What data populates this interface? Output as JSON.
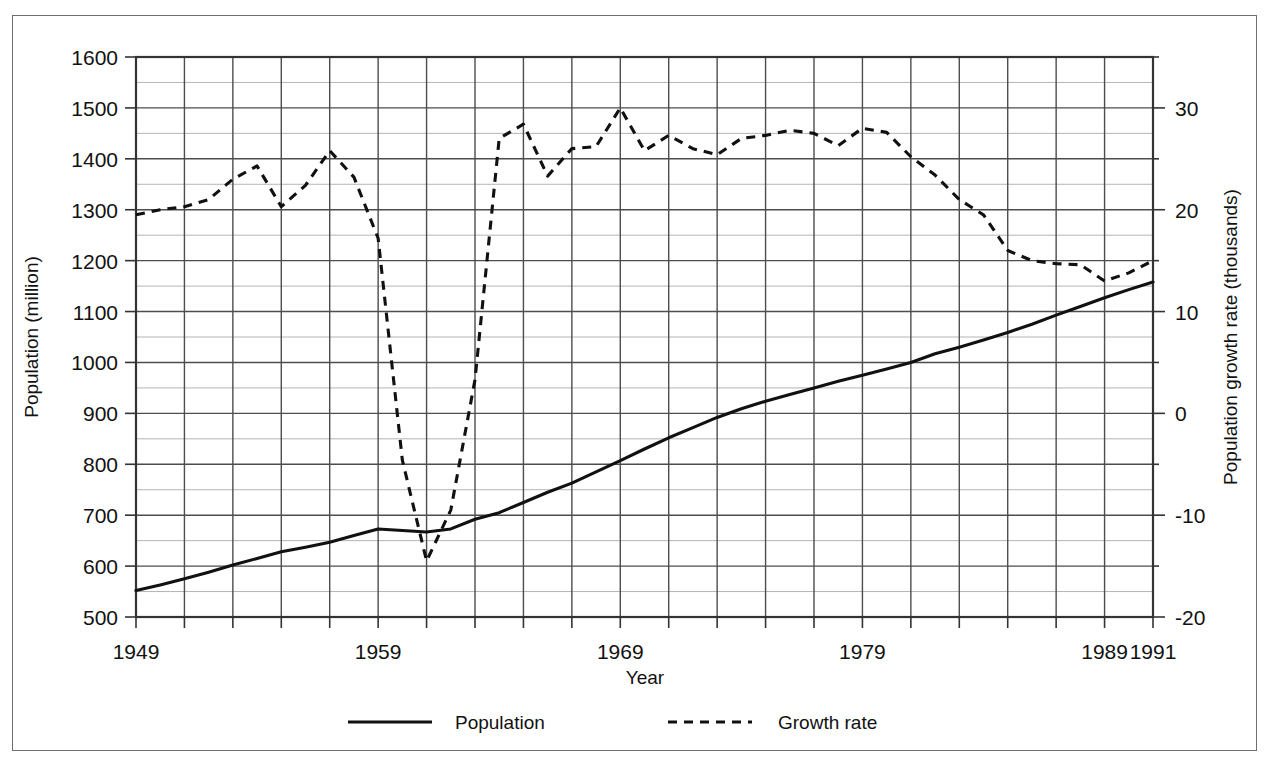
{
  "figure": {
    "left_axis_title": "Population (million)",
    "right_axis_title": "Population growth rate (thousands)",
    "x_axis_title": "Year"
  },
  "legend": {
    "population_label": "Population",
    "growth_label": "Growth rate",
    "population_style": "solid",
    "growth_style": "dashed"
  },
  "colors": {
    "line": "#111111",
    "major_grid": "#4d4d4d",
    "minor_grid": "#b4b4b4",
    "frame": "#6e6e6e",
    "text": "#111111"
  },
  "chart_data": {
    "type": "line",
    "title": "",
    "xlabel": "Year",
    "ylabel": "Population (million)",
    "y2label": "Population growth rate (thousands)",
    "xlim": [
      1949,
      1991
    ],
    "ylim": [
      500,
      1600
    ],
    "y2lim": [
      -20,
      35
    ],
    "grid": true,
    "legend_position": "bottom",
    "x_major_ticks": [
      1949,
      1959,
      1969,
      1979,
      1989,
      1991
    ],
    "x_tick_labels": [
      "1949",
      "1959",
      "1969",
      "1979",
      "1989",
      "1991"
    ],
    "x_minor_tick_step": 2,
    "y_major_ticks": [
      500,
      600,
      700,
      800,
      900,
      1000,
      1100,
      1200,
      1300,
      1400,
      1500,
      1600
    ],
    "y_tick_labels": [
      "500",
      "600",
      "700",
      "800",
      "900",
      "1000",
      "1100",
      "1200",
      "1300",
      "1400",
      "1500",
      "1600"
    ],
    "y_minor_tick_step": 50,
    "y2_major_ticks": [
      -20,
      -10,
      0,
      10,
      20,
      30
    ],
    "y2_tick_labels": [
      "-20",
      "-10",
      "0",
      "10",
      "20",
      "30"
    ],
    "y2_minor_tick_step": 5,
    "x": [
      1949,
      1950,
      1951,
      1952,
      1953,
      1954,
      1955,
      1956,
      1957,
      1958,
      1959,
      1960,
      1961,
      1962,
      1963,
      1964,
      1965,
      1966,
      1967,
      1968,
      1969,
      1970,
      1971,
      1972,
      1973,
      1974,
      1975,
      1976,
      1977,
      1978,
      1979,
      1980,
      1981,
      1982,
      1983,
      1984,
      1985,
      1986,
      1987,
      1988,
      1989,
      1990,
      1991
    ],
    "series": [
      {
        "name": "Population",
        "axis": "left",
        "style": "solid",
        "unit": "million",
        "values": [
          552,
          563,
          575,
          588,
          602,
          615,
          628,
          637,
          647,
          660,
          673,
          670,
          667,
          673,
          692,
          705,
          725,
          745,
          763,
          785,
          807,
          830,
          852,
          872,
          892,
          909,
          924,
          937,
          950,
          963,
          975,
          987,
          1000,
          1017,
          1030,
          1044,
          1059,
          1075,
          1093,
          1110,
          1127,
          1143,
          1158
        ]
      },
      {
        "name": "Growth rate",
        "axis": "right",
        "style": "dashed",
        "unit": "thousands",
        "values": [
          19.5,
          20.0,
          20.3,
          21.0,
          23.0,
          24.3,
          20.3,
          22.4,
          25.8,
          23.2,
          17.2,
          -4.6,
          -14.5,
          -9.5,
          3.3,
          27.0,
          28.4,
          23.3,
          26.0,
          26.2,
          30.0,
          25.8,
          27.3,
          26.0,
          25.4,
          27.0,
          27.3,
          27.8,
          27.5,
          26.3,
          28.0,
          27.6,
          25.2,
          23.4,
          21.0,
          19.5,
          16.0,
          15.0,
          14.7,
          14.6,
          13.0,
          13.8,
          15.0
        ]
      }
    ]
  }
}
